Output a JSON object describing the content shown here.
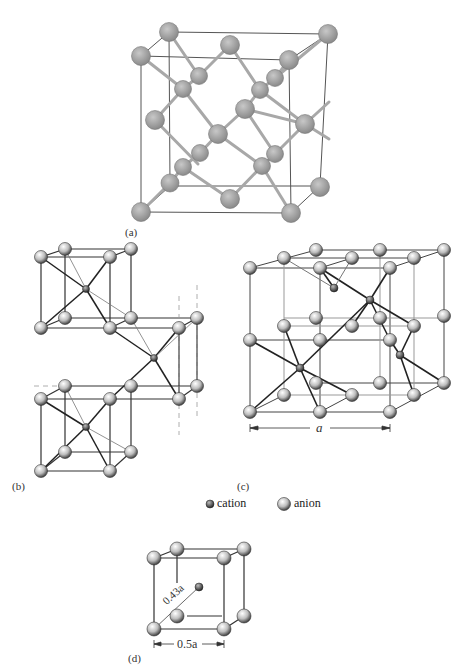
{
  "figure": {
    "panels": [
      {
        "id": "a",
        "label": "(a)",
        "description": "diamond cubic structure"
      },
      {
        "id": "b",
        "label": "(b)",
        "description": "stacked cubes with body-centered cations"
      },
      {
        "id": "c",
        "label": "(c)",
        "description": "zinc blende style cell",
        "dimension_label": "a"
      },
      {
        "id": "d",
        "label": "(d)",
        "description": "small cube, cation at body center",
        "diagonal_label": "0.43a",
        "edge_label": "0.5a"
      }
    ],
    "legend": [
      {
        "key": "cation",
        "label": "cation",
        "icon": "small-sphere-icon"
      },
      {
        "key": "anion",
        "label": "anion",
        "icon": "large-sphere-icon"
      }
    ]
  }
}
